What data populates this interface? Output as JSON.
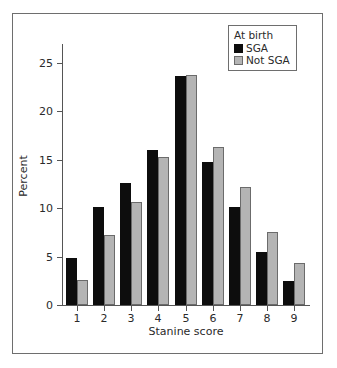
{
  "chart_data": {
    "type": "bar",
    "title": "",
    "subtitle": "",
    "xlabel": "Stanine score",
    "ylabel": "Percent",
    "categories": [
      "1",
      "2",
      "3",
      "4",
      "5",
      "6",
      "7",
      "8",
      "9"
    ],
    "series": [
      {
        "name": "SGA",
        "color": "#0d0d0d",
        "values": [
          4.8,
          10.1,
          12.6,
          16.0,
          23.6,
          14.7,
          10.1,
          5.5,
          2.5
        ]
      },
      {
        "name": "Not SGA",
        "color": "#b4b4b4",
        "values": [
          2.6,
          7.2,
          10.6,
          15.3,
          23.7,
          16.3,
          12.2,
          7.5,
          4.3
        ]
      }
    ],
    "ylim": [
      0,
      26.5
    ],
    "yticks": [
      0,
      5,
      10,
      15,
      20,
      25
    ],
    "ytick_labels": [
      "0",
      "5",
      "10",
      "15",
      "20",
      "25"
    ],
    "xtick_labels": [
      "1",
      "2",
      "3",
      "4",
      "5",
      "6",
      "7",
      "8",
      "9"
    ],
    "grid": false,
    "legend": {
      "position": "top-right",
      "title": "At birth",
      "entries": [
        {
          "label": "SGA",
          "color": "#0d0d0d"
        },
        {
          "label": "Not SGA",
          "color": "#b4b4b4"
        }
      ]
    }
  },
  "figure": {
    "background": "#ffffff",
    "frame_color": "#6e6e6e",
    "axis_color": "#555555",
    "text_color": "#2a2a2a"
  }
}
